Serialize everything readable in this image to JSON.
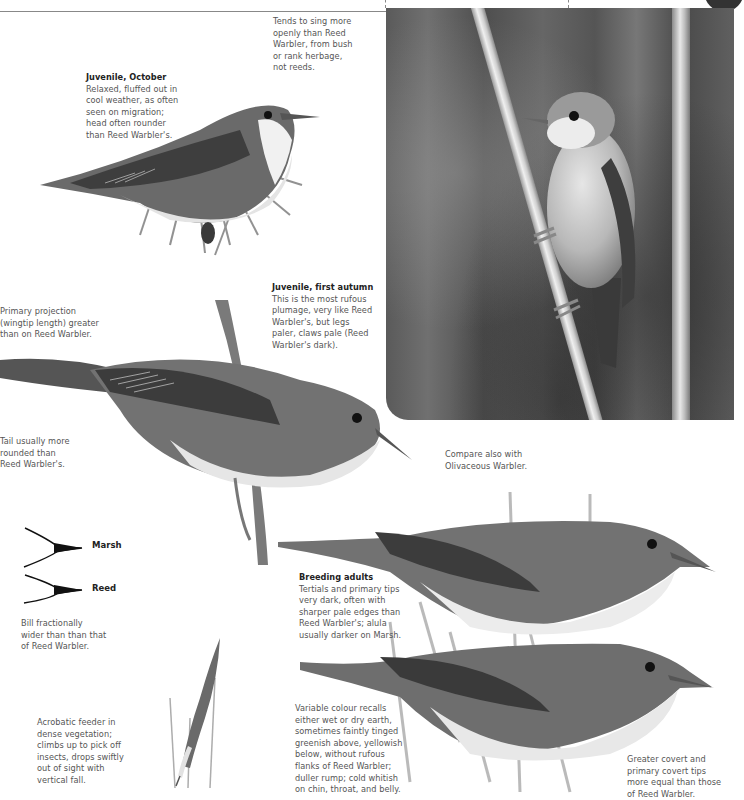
{
  "header": {
    "top_box_fragment": "visual clues."
  },
  "notes": {
    "song": {
      "body": "Tends to sing more\nopenly than Reed\nWarbler, from bush\nor rank herbage,\nnot reeds."
    },
    "juvenile_october": {
      "title": "Juvenile, October",
      "body": "Relaxed, fluffed out in\ncool weather, as often\nseen on migration;\nhead often rounder\nthan Reed Warbler's."
    },
    "primary_projection": {
      "body": "Primary projection\n(wingtip length) greater\nthan on Reed Warbler."
    },
    "juvenile_first_autumn": {
      "title": "Juvenile, first autumn",
      "body": "This is the most rufous\nplumage, very like Reed\nWarbler's, but legs\npaler, claws pale (Reed\nWarbler's dark)."
    },
    "tail": {
      "body": "Tail usually more\nrounded than\nReed Warbler's."
    },
    "compare": {
      "body": "Compare also with\nOlivaceous Warbler."
    },
    "bill": {
      "body": "Bill fractionally\nwider than than that\nof Reed Warbler."
    },
    "breeding_adults": {
      "title": "Breeding adults",
      "body": "Tertials and primary tips\nvery dark, often with\nsharper pale edges than\nReed Warbler's; alula\nusually darker on Marsh."
    },
    "acrobatic": {
      "body": "Acrobatic feeder in\ndense vegetation;\nclimbs up to pick off\ninsects, drops swiftly\nout of sight with\nvertical fall."
    },
    "variable_colour": {
      "body": "Variable colour recalls\neither wet or dry earth,\nsometimes faintly tinged\ngreenish above, yellowish\nbelow, without rufous\nflanks of Reed Warbler;\nduller rump; cold whitish\non chin, throat, and belly."
    },
    "coverts": {
      "body": "Greater covert and\nprimary covert tips\nmore equal than those\nof Reed Warbler."
    }
  },
  "bill_comparison": {
    "labels": [
      "Marsh",
      "Reed"
    ]
  },
  "photo": {
    "subject": "warbler perched on reed stem"
  }
}
